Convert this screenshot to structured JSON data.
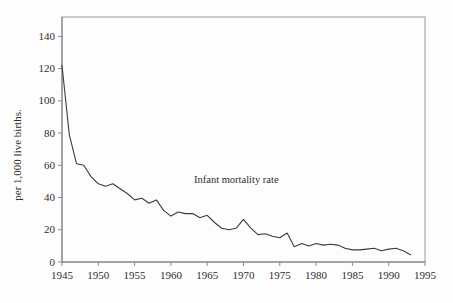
{
  "figure": {
    "background_color": "#fdfdfd",
    "line_color": "#3c3c3c",
    "axis_color": "#9a9a9a",
    "text_color": "#2f2f2f"
  },
  "chart_data": {
    "type": "line",
    "title": "",
    "xlabel": "",
    "ylabel": "per 1,000 live births.",
    "annotation": "Infant mortality rate",
    "grid": false,
    "legend_position": "inline-annotation",
    "xlim": [
      1945,
      1995
    ],
    "ylim": [
      0,
      152
    ],
    "x_ticks": [
      1945,
      1950,
      1955,
      1960,
      1965,
      1970,
      1975,
      1980,
      1985,
      1990,
      1995
    ],
    "y_ticks": [
      0,
      20,
      40,
      60,
      80,
      100,
      120,
      140
    ],
    "x": [
      1945,
      1946,
      1947,
      1948,
      1949,
      1950,
      1951,
      1952,
      1953,
      1954,
      1955,
      1956,
      1957,
      1958,
      1959,
      1960,
      1961,
      1962,
      1963,
      1964,
      1965,
      1966,
      1967,
      1968,
      1969,
      1970,
      1971,
      1972,
      1973,
      1974,
      1975,
      1976,
      1977,
      1978,
      1979,
      1980,
      1981,
      1982,
      1983,
      1984,
      1985,
      1986,
      1987,
      1988,
      1989,
      1990,
      1991,
      1992,
      1993
    ],
    "values": [
      122,
      79,
      61,
      60,
      53,
      48.5,
      47,
      48.5,
      45.5,
      42.5,
      38.5,
      39.5,
      36.5,
      38.5,
      32,
      28.5,
      31,
      30,
      30,
      27.5,
      29,
      24.5,
      21,
      20,
      21,
      26.5,
      21,
      17,
      17.5,
      16,
      15,
      18,
      9.5,
      11.5,
      10,
      11.5,
      10.5,
      11,
      10.5,
      8.5,
      7.5,
      7.5,
      8,
      8.5,
      7,
      8,
      8.5,
      7,
      4.5
    ]
  }
}
